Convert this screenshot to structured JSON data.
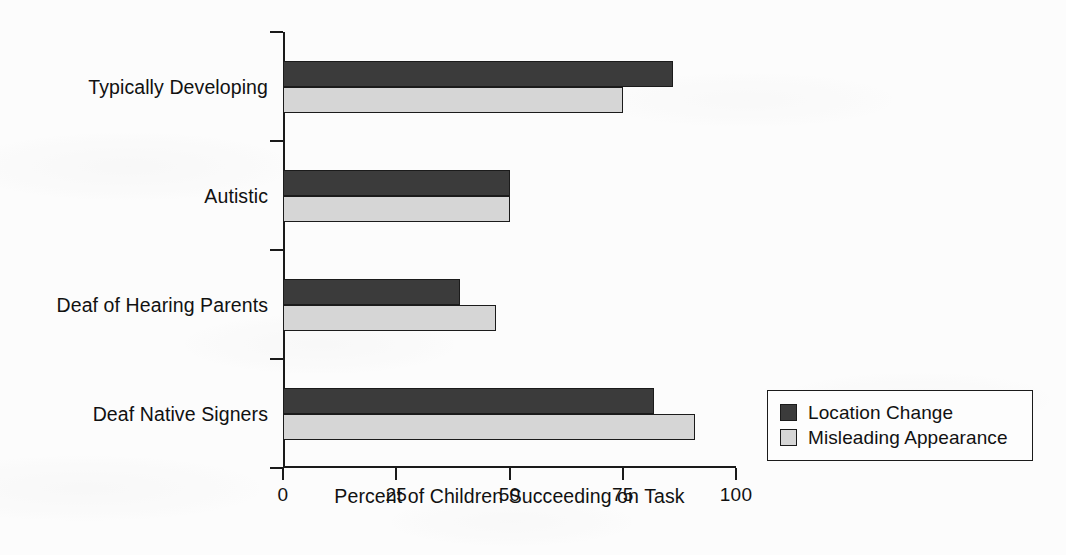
{
  "chart_data": {
    "type": "bar",
    "orientation": "horizontal",
    "title": "",
    "xlabel": "Percent of Children Succeeding on Task",
    "ylabel": "",
    "xlim": [
      0,
      100
    ],
    "xticks": [
      0,
      25,
      50,
      75,
      100
    ],
    "xtick_labels": [
      "0",
      "25",
      "50",
      "75",
      "100"
    ],
    "grid": false,
    "legend_position": "bottom-right",
    "categories": [
      "Typically Developing",
      "Autistic",
      "Deaf of Hearing Parents",
      "Deaf Native Signers"
    ],
    "series": [
      {
        "name": "Location Change",
        "color": "#3b3b3b",
        "values": [
          86,
          50,
          39,
          82
        ]
      },
      {
        "name": "Misleading Appearance",
        "color": "#d6d6d6",
        "values": [
          75,
          50,
          47,
          91
        ]
      }
    ]
  },
  "legend": {
    "entries": [
      {
        "label": "Location Change",
        "swatch": "#3b3b3b"
      },
      {
        "label": "Misleading Appearance",
        "swatch": "#d6d6d6"
      }
    ]
  },
  "axes": {
    "x_title": "Percent of Children Succeeding on Task"
  }
}
